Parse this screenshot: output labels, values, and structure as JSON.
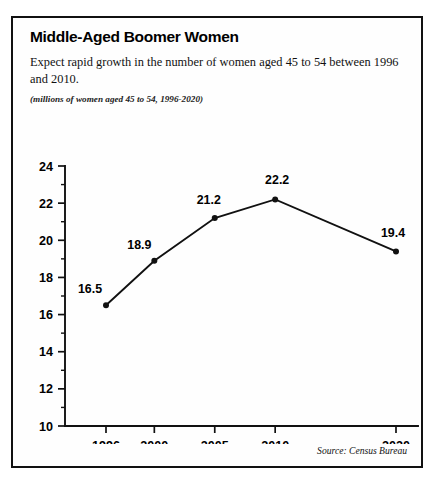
{
  "figure": {
    "title": "Middle-Aged Boomer Women",
    "subtitle": "Expect rapid growth in the number of women aged 45 to 54 between 1996 and 2010.",
    "units_note": "(millions of women aged 45 to 54, 1996-2020)",
    "source": "Source: Census Bureau",
    "border_color": "#111111",
    "background_color": "#fefefe"
  },
  "chart_data": {
    "type": "line",
    "title": "Middle-Aged Boomer Women",
    "subtitle": "Expect rapid growth in the number of women aged 45 to 54 between 1996 and 2010.",
    "xlabel": "",
    "ylabel": "",
    "ylim": [
      10,
      24
    ],
    "xlim": [
      1994,
      2022
    ],
    "ytick_step": 2,
    "yticks": [
      10,
      12,
      14,
      16,
      18,
      20,
      22,
      24
    ],
    "ytick_labels": [
      "10",
      "12",
      "14",
      "16",
      "18",
      "20",
      "22",
      "24"
    ],
    "minor_ytick_step": 1,
    "categories": [
      1996,
      2000,
      2005,
      2010,
      2020
    ],
    "xtick_labels": [
      "1996",
      "2000",
      "2005",
      "2010",
      "2020"
    ],
    "values": [
      16.5,
      18.9,
      21.2,
      22.2,
      19.4
    ],
    "point_labels": [
      "16.5",
      "18.9",
      "21.2",
      "22.2",
      "19.4"
    ],
    "label_offsets": [
      {
        "dx": -16,
        "dy": -12
      },
      {
        "dx": -15,
        "dy": -12
      },
      {
        "dx": -6,
        "dy": -14
      },
      {
        "dx": 2,
        "dy": -15
      },
      {
        "dx": -3,
        "dy": -14
      }
    ],
    "grid": false,
    "legend": false,
    "line_color": "#111111",
    "marker_color": "#111111",
    "marker_size": 3,
    "source": "Source: Census Bureau"
  }
}
